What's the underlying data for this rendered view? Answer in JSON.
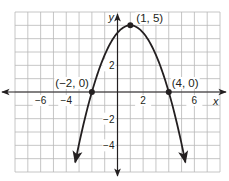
{
  "chart_data": {
    "type": "line",
    "title": "",
    "xlabel": "x",
    "ylabel": "y",
    "xlim": [
      -8,
      8
    ],
    "ylim": [
      -6,
      6
    ],
    "grid": true,
    "x_ticks": [
      {
        "value": -6,
        "label": "−6"
      },
      {
        "value": -4,
        "label": "−4"
      },
      {
        "value": 2,
        "label": "2"
      },
      {
        "value": 6,
        "label": "6"
      }
    ],
    "y_ticks": [
      {
        "value": 2,
        "label": "2"
      },
      {
        "value": -2,
        "label": "−2"
      },
      {
        "value": -4,
        "label": "−4"
      }
    ],
    "series": [
      {
        "name": "parabola",
        "equation": "y = -5/9 (x - 1)^2 + 5",
        "a": -0.5556,
        "h": 1,
        "k": 5,
        "x_range": [
          -3.3,
          5.3
        ],
        "color": "#231f20"
      }
    ],
    "points": [
      {
        "x": 1,
        "y": 5,
        "label": "(1, 5)"
      },
      {
        "x": -2,
        "y": 0,
        "label": "(−2, 0)"
      },
      {
        "x": 4,
        "y": 0,
        "label": "(4, 0)"
      }
    ]
  },
  "colors": {
    "grid": "#b8b8b8",
    "axis": "#231f20",
    "curve": "#231f20"
  }
}
